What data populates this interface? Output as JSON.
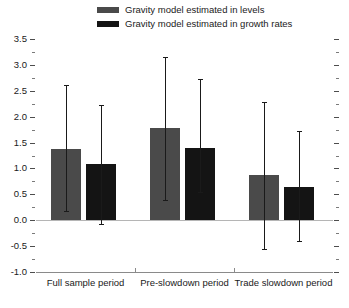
{
  "legend": {
    "position": "top",
    "entries": [
      {
        "label": "Gravity model estimated in levels",
        "color": "#4a4a4a"
      },
      {
        "label": "Gravity model estimated in growth rates",
        "color": "#141414"
      }
    ]
  },
  "chart_data": {
    "type": "bar",
    "title": "",
    "subtitle": "",
    "xlabel": "",
    "ylabel": "",
    "ylim": [
      -1.0,
      3.5
    ],
    "grid": false,
    "legend_position": "top",
    "error_bars": true,
    "categories": [
      "Full sample period",
      "Pre-slowdown period",
      "Trade slowdown period"
    ],
    "ytick_labels": [
      "3.5",
      "3.0",
      "2.5",
      "2.0",
      "1.5",
      "1.0",
      "0.5",
      "0.0",
      "-0.5",
      "-1.0"
    ],
    "ytick_values": [
      3.5,
      3.0,
      2.5,
      2.0,
      1.5,
      1.0,
      0.5,
      0.0,
      -0.5,
      -1.0
    ],
    "yminor_values": [
      3.25,
      2.75,
      2.25,
      1.75,
      1.25,
      0.75,
      0.25,
      -0.25,
      -0.75
    ],
    "series": [
      {
        "name": "Gravity model estimated in levels",
        "color": "#4a4a4a",
        "values": [
          1.38,
          1.78,
          0.87
        ],
        "err_low": [
          0.17,
          0.4,
          -0.55
        ],
        "err_high": [
          2.62,
          3.15,
          2.28
        ]
      },
      {
        "name": "Gravity model estimated in growth rates",
        "color": "#141414",
        "values": [
          1.08,
          1.4,
          0.64
        ],
        "err_low": [
          -0.08,
          0.55,
          -0.4
        ],
        "err_high": [
          2.23,
          2.72,
          1.72
        ]
      }
    ]
  }
}
